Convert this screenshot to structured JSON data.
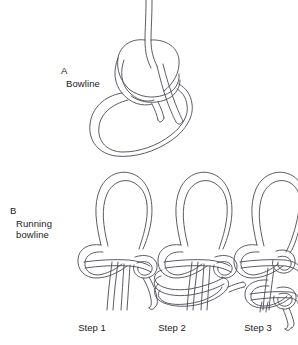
{
  "figure": {
    "background_color": "#ffffff",
    "line_color": "#4a4a52",
    "text_color": "#1a1a1a"
  },
  "panels": [
    {
      "letter": "A",
      "name": "Bowline",
      "letter_x": 61,
      "letter_y": 72,
      "name_x": 66,
      "name_y": 85
    },
    {
      "letter": "B",
      "name_line1": "Running",
      "name_line2": "bowline",
      "letter_x": 10,
      "letter_y": 212,
      "name_x": 16,
      "name_y": 225
    }
  ],
  "captions": [
    {
      "label": "Step 1",
      "center_x": 92,
      "y": 322
    },
    {
      "label": "Step 2",
      "center_x": 172,
      "y": 322
    },
    {
      "label": "Step 3",
      "center_x": 258,
      "y": 322
    }
  ]
}
